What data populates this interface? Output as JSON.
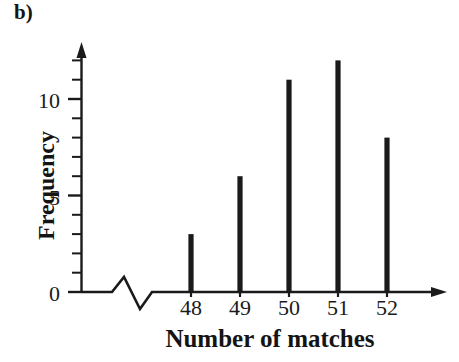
{
  "panel": {
    "letter": "b)"
  },
  "chart_data": {
    "type": "bar",
    "title": "",
    "subtitle": "",
    "panel_label": "b)",
    "xlabel": "Number of matches",
    "ylabel": "Frequency",
    "categories": [
      "48",
      "49",
      "50",
      "51",
      "52"
    ],
    "values": [
      3,
      6,
      11,
      12,
      8
    ],
    "series": [
      {
        "name": "Frequency",
        "values": [
          3,
          6,
          11,
          12,
          8
        ]
      }
    ],
    "xlim": [
      47.5,
      52.9
    ],
    "ylim": [
      0,
      12.8
    ],
    "y_ticks_labeled": [
      "0",
      "5",
      "10"
    ],
    "y_tick_values_labeled": [
      0,
      5,
      10
    ],
    "y_minor_tick_values": [
      1,
      2,
      3,
      4,
      6,
      7,
      8,
      9,
      11,
      12
    ],
    "grid": false,
    "legend": false,
    "legend_position": "none",
    "axis_break_x": true,
    "axis_break_note": "zigzag break on x-axis between origin and first category",
    "arrow_heads": [
      "x-axis-right",
      "y-axis-top"
    ],
    "bar_color": "#1a1a1a",
    "axis_color": "#1a1a1a",
    "background_color": "#ffffff",
    "annotations": []
  }
}
